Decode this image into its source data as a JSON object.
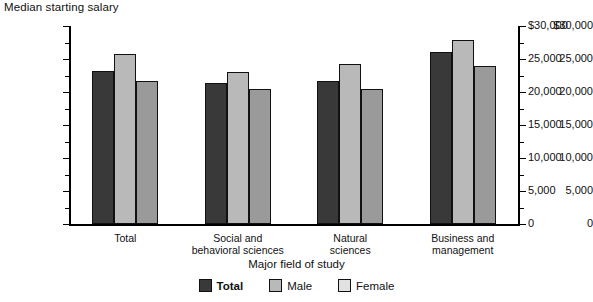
{
  "chart_data": {
    "type": "bar",
    "title": "Median starting salary",
    "xlabel": "Major field of study",
    "ylabel": "",
    "ylim": [
      0,
      30000
    ],
    "ytick_values": [
      30000,
      25000,
      20000,
      15000,
      10000,
      5000,
      0
    ],
    "ytick_labels_left": [
      "$30,000",
      "25,000",
      "20,000",
      "15,000",
      "10,000",
      "5,000",
      "0"
    ],
    "ytick_labels_right": [
      "$30,000",
      "25,000",
      "20,000",
      "15,000",
      "10,000",
      "5,000",
      "0"
    ],
    "grid": false,
    "legend_position": "bottom",
    "categories": [
      "Total",
      "Social and\nbehavioral sciences",
      "Natural\nsciences",
      "Business and\nmanagement"
    ],
    "series": [
      {
        "name": "Total",
        "color": "#393939",
        "values": [
          23200,
          21300,
          21700,
          26100
        ]
      },
      {
        "name": "Male",
        "color": "#b9b9b9",
        "values": [
          25800,
          23100,
          24200,
          27900
        ]
      },
      {
        "name": "Female",
        "color": "#9a9a9a",
        "values": [
          21700,
          20400,
          20500,
          23900
        ]
      }
    ]
  },
  "legend": {
    "items": [
      {
        "label": "Total",
        "swatch": "total"
      },
      {
        "label": "Male",
        "swatch": "male"
      },
      {
        "label": "Female",
        "swatch": "female"
      }
    ]
  }
}
